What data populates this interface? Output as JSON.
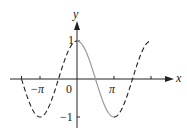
{
  "chart_data": {
    "type": "line",
    "title": "",
    "function": "y = cos(x)",
    "xlabel": "x",
    "ylabel": "y",
    "xlim": [
      -4.71,
      6.28
    ],
    "ylim": [
      -1,
      1
    ],
    "x_tick_labels": [
      {
        "value": -3.1416,
        "label": "−π"
      },
      {
        "value": 0,
        "label": "0"
      },
      {
        "value": 3.1416,
        "label": "π"
      }
    ],
    "x_ticks": [
      -4.7124,
      -3.1416,
      3.1416,
      6.2832
    ],
    "y_tick_labels": [
      {
        "value": 1,
        "label": "1"
      },
      {
        "value": -1,
        "label": "−1"
      }
    ],
    "series": [
      {
        "name": "cos(x) on [0, π]",
        "style": "solid",
        "color": "#999999",
        "x_range": [
          0,
          3.1416
        ]
      },
      {
        "name": "cos(x) elsewhere",
        "style": "dashed",
        "color": "#222222",
        "x_range": [
          -4.7124,
          6.2832
        ]
      }
    ],
    "key_points": [
      {
        "x": -3.1416,
        "y": -1
      },
      {
        "x": -1.5708,
        "y": 0
      },
      {
        "x": 0,
        "y": 1
      },
      {
        "x": 1.5708,
        "y": 0
      },
      {
        "x": 3.1416,
        "y": -1
      },
      {
        "x": 4.7124,
        "y": 0
      },
      {
        "x": 6.2832,
        "y": 1
      }
    ],
    "grid": false
  },
  "labels": {
    "x_axis": "x",
    "y_axis": "y",
    "origin": "0",
    "neg_pi": "−π",
    "pi": "π",
    "one": "1",
    "neg_one": "−1"
  },
  "colors": {
    "axis": "#222222",
    "solid_curve": "#999999",
    "dashed_curve": "#222222"
  }
}
